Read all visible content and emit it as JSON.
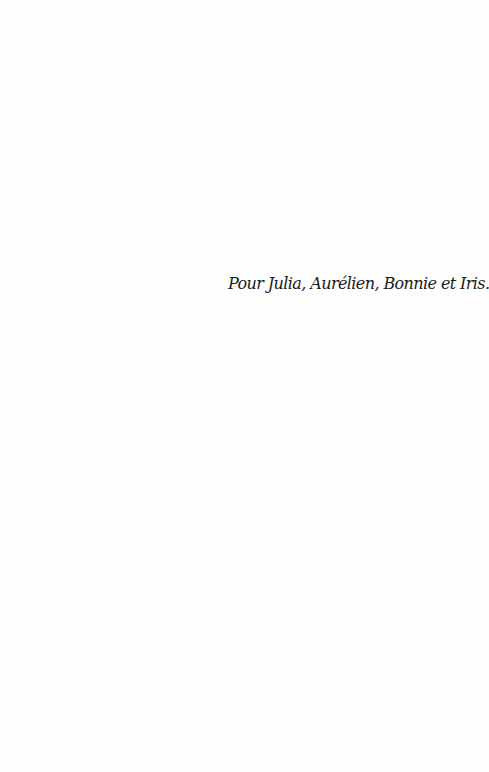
{
  "page": {
    "dedication": "Pour Julia, Aurélien, Bonnie et Iris."
  }
}
